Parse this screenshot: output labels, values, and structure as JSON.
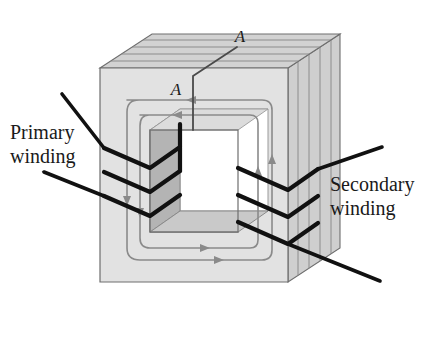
{
  "figure": {
    "labels": {
      "primary": "Primary\nwinding",
      "primary_line1": "Primary",
      "primary_line2": "winding",
      "secondary_line1": "Secondary",
      "secondary_line2": "winding",
      "cut_label_top": "A",
      "cut_label_inner": "A"
    },
    "colors": {
      "background": "#ffffff",
      "core_front": "#e2e2e2",
      "core_top": "#d2d2d2",
      "core_side": "#cfcfcf",
      "window_back": "#ffffff",
      "window_inner_left": "#b4b4b4",
      "window_inner_floor": "#c9c9c9",
      "outline": "#6e6e6e",
      "lamination_line": "#8c8c8c",
      "flux_line": "#8a8a8a",
      "winding_wire": "#111111",
      "text": "#1a1a1a"
    },
    "geometry": {
      "depth_dx": 52,
      "depth_dy": -34,
      "core_outer_left": 100,
      "core_outer_top": 68,
      "core_outer_right": 288,
      "core_outer_bottom": 282,
      "window_left": 150,
      "window_top": 130,
      "window_right": 238,
      "window_bottom": 232
    },
    "lamination_counts": {
      "top_face_stripes": 4,
      "side_face_stripes": 4
    },
    "flux": {
      "loops": 2,
      "direction": "counterclockwise",
      "arrow_count": 8,
      "description": "magnetic flux circulating around the closed core"
    },
    "windings": {
      "primary": {
        "side": "left",
        "turns": 3,
        "leads": 2,
        "color": "#111111"
      },
      "secondary": {
        "side": "right",
        "turns": 3,
        "leads": 2,
        "color": "#111111"
      }
    },
    "cut_line": {
      "label": "A",
      "description": "section cut line A-A across the top limb"
    }
  }
}
